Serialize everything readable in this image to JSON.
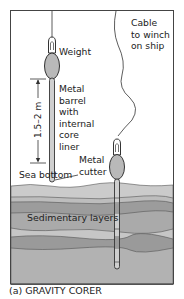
{
  "figure": {
    "caption": "(a) GRAVITY CORER",
    "labels": {
      "weight": "Weight",
      "barrel_line1": "Metal",
      "barrel_line2": "barrel",
      "barrel_line3": "with",
      "barrel_line4": "internal",
      "barrel_line5": "core",
      "barrel_line6": "liner",
      "cutter_line1": "Metal",
      "cutter_line2": "cutter",
      "sea_bottom": "Sea bottom",
      "cable_line1": "Cable",
      "cable_line2": "to winch",
      "cable_line3": "on ship",
      "dimension": "1.5–2 m",
      "sediment": "Sedimentary layers"
    },
    "colors": {
      "water": "#ffffff",
      "frame": "#444444",
      "weight_fill": "#b9b9b9",
      "layer_1": "#cbcbcb",
      "layer_2": "#bdbdbd",
      "layer_3": "#9c9c9c",
      "layer_4": "#aaaaaa",
      "layer_5": "#c6c6c6",
      "layer_6": "#9a9a9a",
      "layer_7": "#b2b2b2"
    }
  }
}
